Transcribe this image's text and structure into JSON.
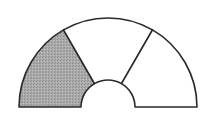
{
  "diagram": {
    "type": "semi-annulus",
    "center": [
      108,
      107
    ],
    "outer_radius": 89,
    "inner_radius": 27,
    "sectors": [
      {
        "name": "left",
        "start_deg": 180,
        "end_deg": 120,
        "shaded": true
      },
      {
        "name": "middle",
        "start_deg": 120,
        "end_deg": 60,
        "shaded": false
      },
      {
        "name": "right",
        "start_deg": 60,
        "end_deg": 0,
        "shaded": false
      }
    ],
    "shaded_fraction": "1/3",
    "colors": {
      "stroke": "#2a2a2a",
      "shade": "#a9a9a9",
      "shade_dots": "#8a8a8a",
      "unshaded": "#ffffff",
      "background": "#ffffff"
    }
  }
}
